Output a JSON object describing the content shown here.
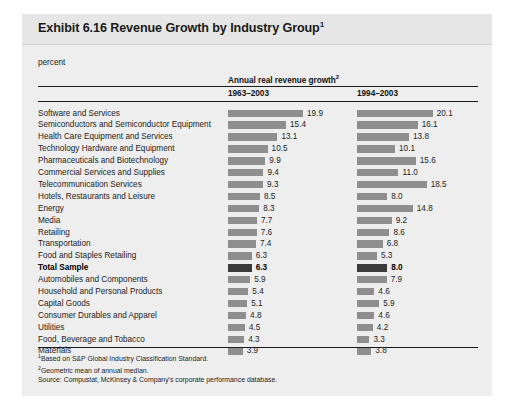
{
  "exhibit": {
    "title": "Exhibit 6.16 Revenue Growth by Industry Group",
    "title_footnote_marker": "1",
    "units_label": "percent"
  },
  "table_header": {
    "group_label": "Annual real revenue growth",
    "group_footnote_marker": "2",
    "column_1": "1963–2003",
    "column_2": "1994–2003"
  },
  "footnotes": {
    "note_1_marker": "1",
    "note_1": "Based on S&P Global Industry Classification Standard.",
    "note_2_marker": "2",
    "note_2": "Geometric mean of annual median.",
    "source": "Source: Compustat, McKinsey & Company's corporate performance database."
  },
  "colors": {
    "bar": "#8e8e8e",
    "bar_total": "#3b3b3b",
    "card_background": "#eeeeee",
    "title_band": "#e6e6e6"
  },
  "chart_data": {
    "type": "bar",
    "title": "Exhibit 6.16 Revenue Growth by Industry Group",
    "xlabel": "percent",
    "ylabel": "",
    "grid": false,
    "legend_position": "none",
    "xlim": [
      0,
      21
    ],
    "categories": [
      "Software and Services",
      "Semiconductors and Semiconductor Equipment",
      "Health Care Equipment and Services",
      "Technology Hardware and Equipment",
      "Pharmaceuticals and Biotechnology",
      "Commercial Services and Supplies",
      "Telecommunication Services",
      "Hotels, Restaurants and Leisure",
      "Energy",
      "Media",
      "Retailing",
      "Transportation",
      "Food and Staples Retailing",
      "Total Sample",
      "Automobiles and Components",
      "Household and Personal Products",
      "Capital Goods",
      "Consumer Durables and Apparel",
      "Utilities",
      "Food, Beverage and Tobacco",
      "Materials"
    ],
    "series": [
      {
        "name": "1963–2003",
        "values": [
          19.9,
          15.4,
          13.1,
          10.5,
          9.9,
          9.4,
          9.3,
          8.5,
          8.3,
          7.7,
          7.6,
          7.4,
          6.3,
          6.3,
          5.9,
          5.4,
          5.1,
          4.8,
          4.5,
          4.3,
          3.9
        ]
      },
      {
        "name": "1994–2003",
        "values": [
          20.1,
          16.1,
          13.8,
          10.1,
          15.6,
          11.0,
          18.5,
          8.0,
          14.8,
          9.2,
          8.6,
          6.8,
          5.3,
          8.0,
          7.9,
          4.6,
          5.9,
          4.6,
          4.2,
          3.3,
          3.8
        ]
      }
    ],
    "highlight_category": "Total Sample"
  }
}
